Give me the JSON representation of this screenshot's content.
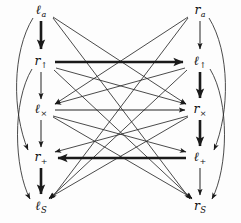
{
  "figure": {
    "kind": "directed-graph",
    "title": "",
    "background": "#fdfdfd",
    "ink": "#1a1a1a",
    "width": 241,
    "height": 223
  },
  "nodes": [
    {
      "id": "l_a",
      "base": "ℓ",
      "sub": "a",
      "sub_style": "italic",
      "label": "ℓa",
      "column": "left",
      "row": 0,
      "x": 41,
      "y": 11
    },
    {
      "id": "r_up",
      "base": "r",
      "sub": "↑",
      "sub_style": "upright",
      "label": "r↑",
      "column": "left",
      "row": 1,
      "x": 41,
      "y": 62
    },
    {
      "id": "l_x",
      "base": "ℓ",
      "sub": "×",
      "sub_style": "upright",
      "label": "ℓ×",
      "column": "left",
      "row": 2,
      "x": 41,
      "y": 110
    },
    {
      "id": "r_p",
      "base": "r",
      "sub": "+",
      "sub_style": "upright",
      "label": "r+",
      "column": "left",
      "row": 3,
      "x": 41,
      "y": 158
    },
    {
      "id": "l_s",
      "base": "ℓ",
      "sub": "S",
      "sub_style": "script",
      "label": "ℓS",
      "column": "left",
      "row": 4,
      "x": 41,
      "y": 207
    },
    {
      "id": "r_a",
      "base": "r",
      "sub": "a",
      "sub_style": "italic",
      "label": "ra",
      "column": "right",
      "row": 0,
      "x": 200,
      "y": 11
    },
    {
      "id": "l_up",
      "base": "ℓ",
      "sub": "↑",
      "sub_style": "upright",
      "label": "ℓ↑",
      "column": "right",
      "row": 1,
      "x": 200,
      "y": 62
    },
    {
      "id": "r_x",
      "base": "r",
      "sub": "×",
      "sub_style": "upright",
      "label": "r×",
      "column": "right",
      "row": 2,
      "x": 200,
      "y": 110
    },
    {
      "id": "l_p",
      "base": "ℓ",
      "sub": "+",
      "sub_style": "upright",
      "label": "ℓ+",
      "column": "right",
      "row": 3,
      "x": 200,
      "y": 158
    },
    {
      "id": "r_s",
      "base": "r",
      "sub": "S",
      "sub_style": "script",
      "label": "rS",
      "column": "right",
      "row": 4,
      "x": 200,
      "y": 207
    }
  ],
  "edges": [
    {
      "from": "l_a",
      "to": "r_up",
      "shape": "vertical",
      "weight": "bold"
    },
    {
      "from": "r_up",
      "to": "l_x",
      "shape": "vertical",
      "weight": "thin"
    },
    {
      "from": "l_x",
      "to": "r_p",
      "shape": "vertical",
      "weight": "thin"
    },
    {
      "from": "r_p",
      "to": "l_s",
      "shape": "vertical",
      "weight": "bold"
    },
    {
      "from": "r_a",
      "to": "l_up",
      "shape": "vertical",
      "weight": "thin"
    },
    {
      "from": "l_up",
      "to": "r_x",
      "shape": "vertical",
      "weight": "bold"
    },
    {
      "from": "r_x",
      "to": "l_p",
      "shape": "vertical",
      "weight": "bold"
    },
    {
      "from": "l_p",
      "to": "r_s",
      "shape": "vertical",
      "weight": "thin"
    },
    {
      "from": "r_up",
      "to": "l_up",
      "shape": "horizontal",
      "weight": "bold",
      "direction": "right"
    },
    {
      "from": "l_x",
      "to": "r_x",
      "shape": "horizontal",
      "weight": "thin",
      "direction": "right"
    },
    {
      "from": "l_p",
      "to": "r_p",
      "shape": "horizontal",
      "weight": "bold",
      "direction": "left"
    },
    {
      "from": "l_a",
      "to": "r_p",
      "shape": "arc-left",
      "weight": "thin"
    },
    {
      "from": "r_up",
      "to": "l_s",
      "shape": "arc-left",
      "weight": "thin"
    },
    {
      "from": "r_a",
      "to": "l_p",
      "shape": "arc-right",
      "weight": "thin"
    },
    {
      "from": "l_up",
      "to": "r_s",
      "shape": "arc-right",
      "weight": "thin"
    },
    {
      "from": "l_a",
      "to": "r_x",
      "shape": "diagonal",
      "weight": "thin"
    },
    {
      "from": "l_a",
      "to": "r_s",
      "shape": "diagonal",
      "weight": "thin"
    },
    {
      "from": "r_a",
      "to": "l_x",
      "shape": "diagonal",
      "weight": "thin"
    },
    {
      "from": "r_a",
      "to": "l_s",
      "shape": "diagonal",
      "weight": "thin"
    },
    {
      "from": "r_up",
      "to": "r_x",
      "shape": "diagonal",
      "weight": "thin"
    },
    {
      "from": "r_up",
      "to": "r_s",
      "shape": "diagonal",
      "weight": "thin"
    },
    {
      "from": "l_up",
      "to": "l_x",
      "shape": "diagonal",
      "weight": "thin"
    },
    {
      "from": "l_up",
      "to": "l_s",
      "shape": "diagonal",
      "weight": "thin"
    },
    {
      "from": "l_x",
      "to": "r_s",
      "shape": "diagonal",
      "weight": "thin"
    },
    {
      "from": "r_x",
      "to": "l_s",
      "shape": "diagonal",
      "weight": "thin"
    },
    {
      "from": "l_x",
      "to": "l_p",
      "shape": "diagonal",
      "weight": "thin"
    },
    {
      "from": "r_x",
      "to": "r_p",
      "shape": "diagonal",
      "weight": "thin"
    }
  ]
}
